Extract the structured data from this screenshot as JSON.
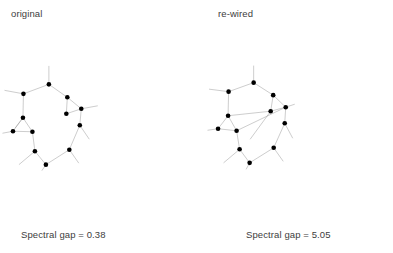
{
  "figure": {
    "background_color": "#ffffff",
    "node_color": "#000000",
    "edge_color": "#8f8f8f",
    "text_color": "#3d3d3d"
  },
  "panels": [
    {
      "key": "original",
      "title": "original",
      "caption": "Spectral gap = 0.38",
      "spectral_gap": 0.38
    },
    {
      "key": "rewired",
      "title": "re-wired",
      "caption": "Spectral gap = 5.05",
      "spectral_gap": 5.05
    }
  ],
  "chart_data": {
    "type": "diagram",
    "title": "",
    "subtitle": "",
    "graphs": [
      {
        "name": "original",
        "label": "original",
        "caption": "Spectral gap = 0.38",
        "spectral_gap": 0.38,
        "node_count": 11,
        "nodes": [
          {
            "id": 0,
            "x": 98,
            "y": 42
          },
          {
            "id": 1,
            "x": 47,
            "y": 61
          },
          {
            "id": 2,
            "x": 135,
            "y": 68
          },
          {
            "id": 3,
            "x": 163,
            "y": 91
          },
          {
            "id": 4,
            "x": 46,
            "y": 109
          },
          {
            "id": 5,
            "x": 133,
            "y": 101
          },
          {
            "id": 6,
            "x": 26,
            "y": 136
          },
          {
            "id": 7,
            "x": 65,
            "y": 137
          },
          {
            "id": 8,
            "x": 160,
            "y": 124
          },
          {
            "id": 9,
            "x": 70,
            "y": 176
          },
          {
            "id": 10,
            "x": 139,
            "y": 173
          },
          {
            "id": 11,
            "x": 92,
            "y": 203
          }
        ],
        "edges": [
          [
            0,
            1
          ],
          [
            0,
            2
          ],
          [
            2,
            3
          ],
          [
            2,
            5
          ],
          [
            3,
            5
          ],
          [
            3,
            8
          ],
          [
            1,
            4
          ],
          [
            4,
            6
          ],
          [
            4,
            7
          ],
          [
            6,
            7
          ],
          [
            7,
            9
          ],
          [
            9,
            11
          ],
          [
            11,
            10
          ],
          [
            10,
            8
          ]
        ],
        "stubs": [
          {
            "from": 0,
            "x2": 98,
            "y2": 5
          },
          {
            "from": 1,
            "x2": 9,
            "y2": 54
          },
          {
            "from": 3,
            "x2": 196,
            "y2": 85
          },
          {
            "from": 6,
            "x2": 5,
            "y2": 140
          },
          {
            "from": 8,
            "x2": 179,
            "y2": 152
          },
          {
            "from": 9,
            "x2": 38,
            "y2": 203
          },
          {
            "from": 10,
            "x2": 158,
            "y2": 200
          },
          {
            "from": 11,
            "x2": 84,
            "y2": 215
          },
          {
            "from": 4,
            "x2": 30,
            "y2": 130
          }
        ]
      },
      {
        "name": "re-wired",
        "label": "re-wired",
        "caption": "Spectral gap = 5.05",
        "spectral_gap": 5.05,
        "node_count": 11,
        "nodes": [
          {
            "id": 0,
            "x": 311,
            "y": 39
          },
          {
            "id": 1,
            "x": 261,
            "y": 57
          },
          {
            "id": 2,
            "x": 350,
            "y": 64
          },
          {
            "id": 3,
            "x": 375,
            "y": 88
          },
          {
            "id": 4,
            "x": 345,
            "y": 96
          },
          {
            "id": 5,
            "x": 260,
            "y": 105
          },
          {
            "id": 6,
            "x": 240,
            "y": 131
          },
          {
            "id": 7,
            "x": 277,
            "y": 135
          },
          {
            "id": 8,
            "x": 373,
            "y": 120
          },
          {
            "id": 9,
            "x": 283,
            "y": 172
          },
          {
            "id": 10,
            "x": 351,
            "y": 169
          },
          {
            "id": 11,
            "x": 303,
            "y": 199
          }
        ],
        "edges": [
          [
            0,
            1
          ],
          [
            0,
            2
          ],
          [
            2,
            3
          ],
          [
            2,
            4
          ],
          [
            3,
            4
          ],
          [
            3,
            8
          ],
          [
            1,
            5
          ],
          [
            5,
            6
          ],
          [
            5,
            7
          ],
          [
            6,
            7
          ],
          [
            7,
            9
          ],
          [
            9,
            11
          ],
          [
            11,
            10
          ],
          [
            10,
            8
          ],
          [
            5,
            4
          ],
          [
            7,
            3
          ]
        ],
        "stubs": [
          {
            "from": 0,
            "x2": 311,
            "y2": 5
          },
          {
            "from": 1,
            "x2": 222,
            "y2": 52
          },
          {
            "from": 3,
            "x2": 393,
            "y2": 82
          },
          {
            "from": 6,
            "x2": 219,
            "y2": 134
          },
          {
            "from": 8,
            "x2": 389,
            "y2": 150
          },
          {
            "from": 9,
            "x2": 251,
            "y2": 199
          },
          {
            "from": 10,
            "x2": 370,
            "y2": 196
          },
          {
            "from": 11,
            "x2": 296,
            "y2": 212
          },
          {
            "from": 4,
            "x2": 304,
            "y2": 152
          }
        ]
      }
    ]
  }
}
